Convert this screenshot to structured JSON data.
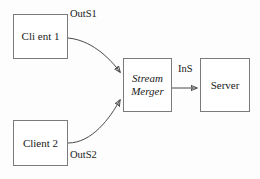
{
  "diagram": {
    "background_color": "#fdfdfd",
    "stroke_color": "#4a4a4a",
    "border_color": "#7a7a7a",
    "text_color": "#1a1a1a",
    "nodes": {
      "client1": {
        "label": "Cli ent 1"
      },
      "client2": {
        "label": "Client 2"
      },
      "stream_merger": {
        "line1": "Stream",
        "line2": "Merger"
      },
      "server": {
        "label": "Server"
      }
    },
    "edges": {
      "client1_to_merger": {
        "label": "OutS1"
      },
      "client2_to_merger": {
        "label": "OutS2"
      },
      "merger_to_server": {
        "label": "InS"
      }
    }
  }
}
